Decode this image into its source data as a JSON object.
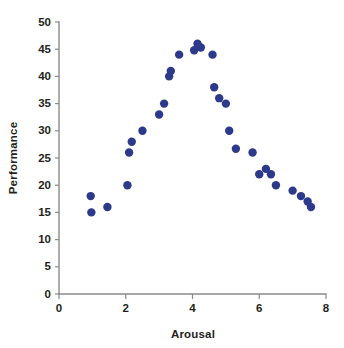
{
  "chart_data": {
    "type": "scatter",
    "title": "",
    "xlabel": "Arousal",
    "ylabel": "Performance",
    "xlim": [
      0,
      8
    ],
    "ylim": [
      0,
      50
    ],
    "xticks": [
      0,
      2,
      4,
      6,
      8
    ],
    "yticks": [
      0,
      5,
      10,
      15,
      20,
      25,
      30,
      35,
      40,
      45,
      50
    ],
    "xtick_labels": [
      "0",
      "2",
      "4",
      "6",
      "8"
    ],
    "ytick_labels": [
      "0",
      "5",
      "10",
      "15",
      "20",
      "25",
      "30",
      "35",
      "40",
      "45",
      "50"
    ],
    "grid": false,
    "legend": false,
    "marker_color": "#2d3a8c",
    "marker_size": 6,
    "points": [
      {
        "x": 0.95,
        "y": 18
      },
      {
        "x": 0.97,
        "y": 15
      },
      {
        "x": 1.45,
        "y": 16
      },
      {
        "x": 2.05,
        "y": 20
      },
      {
        "x": 2.1,
        "y": 26
      },
      {
        "x": 2.18,
        "y": 28
      },
      {
        "x": 2.5,
        "y": 30
      },
      {
        "x": 3.0,
        "y": 33
      },
      {
        "x": 3.15,
        "y": 35
      },
      {
        "x": 3.3,
        "y": 40
      },
      {
        "x": 3.35,
        "y": 41
      },
      {
        "x": 3.6,
        "y": 44
      },
      {
        "x": 4.05,
        "y": 44.8
      },
      {
        "x": 4.15,
        "y": 46
      },
      {
        "x": 4.25,
        "y": 45.3
      },
      {
        "x": 4.6,
        "y": 44
      },
      {
        "x": 4.65,
        "y": 38
      },
      {
        "x": 4.8,
        "y": 36
      },
      {
        "x": 5.0,
        "y": 35
      },
      {
        "x": 5.1,
        "y": 30
      },
      {
        "x": 5.3,
        "y": 26.7
      },
      {
        "x": 5.8,
        "y": 26
      },
      {
        "x": 6.0,
        "y": 22
      },
      {
        "x": 6.2,
        "y": 23
      },
      {
        "x": 6.35,
        "y": 22
      },
      {
        "x": 6.5,
        "y": 20
      },
      {
        "x": 7.0,
        "y": 19
      },
      {
        "x": 7.25,
        "y": 18
      },
      {
        "x": 7.45,
        "y": 17
      },
      {
        "x": 7.55,
        "y": 16
      }
    ]
  },
  "axes": {
    "x_title": "Arousal",
    "y_title": "Performance"
  }
}
